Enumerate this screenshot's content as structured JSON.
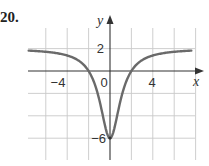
{
  "problem_number": "20.",
  "chart_data": {
    "type": "line",
    "title": "",
    "xlabel": "x",
    "ylabel": "y",
    "xlim": [
      -7.5,
      8
    ],
    "ylim": [
      -8,
      4
    ],
    "grid": true,
    "x_grid_step": 2,
    "y_grid_step": 2,
    "x_tick_labels": [
      {
        "value": -4,
        "label": "−4"
      },
      {
        "value": 0,
        "label": "0"
      },
      {
        "value": 4,
        "label": "4"
      }
    ],
    "y_tick_labels": [
      {
        "value": 2,
        "label": "2"
      },
      {
        "value": -6,
        "label": "−6"
      }
    ],
    "series": [
      {
        "name": "f(x)",
        "description": "Even function with minimum (0,-6), x-intercepts near ±2, horizontal asymptote y=2",
        "x": [
          -7.6,
          -6,
          -5,
          -4,
          -3,
          -2.5,
          -2,
          -1.5,
          -1,
          -0.5,
          0,
          0.5,
          1,
          1.5,
          2,
          2.5,
          3,
          4,
          5,
          6,
          7.6
        ],
        "y": [
          1.82,
          1.71,
          1.59,
          1.38,
          0.92,
          0.46,
          0.0,
          -0.96,
          -2.57,
          -4.4,
          -6.0,
          -4.4,
          -2.57,
          -0.96,
          0.0,
          0.46,
          0.92,
          1.38,
          1.59,
          1.71,
          1.82
        ]
      }
    ],
    "annotations": [
      {
        "type": "asymptote",
        "y": 2,
        "note": "curve approaches y = 2"
      },
      {
        "type": "point",
        "x": 0,
        "y": -6,
        "note": "minimum"
      }
    ]
  }
}
